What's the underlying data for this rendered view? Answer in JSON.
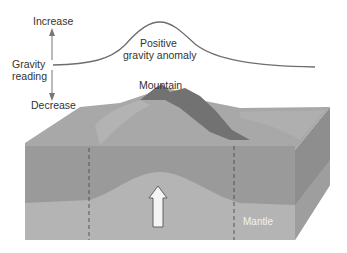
{
  "axis": {
    "increase_label": "Increase",
    "gravity_label_line1": "Gravity",
    "gravity_label_line2": "reading",
    "decrease_label": "Decrease"
  },
  "curve": {
    "label_line1": "Positive",
    "label_line2": "gravity anomaly"
  },
  "block": {
    "mountain_label": "Mountain",
    "mantle_label": "Mantle",
    "arrow": "upward-arrow"
  },
  "colors": {
    "curve": "#6e6e6e",
    "crust": "#9a9a9a",
    "mantle": "#b4b4b4",
    "side_face": "#8e8e8e",
    "top_surface": "#a8a8a8",
    "mountain_dark": "#6f6f6f",
    "dashed_line": "#555555",
    "arrow_fill": "#f4f4f4"
  }
}
